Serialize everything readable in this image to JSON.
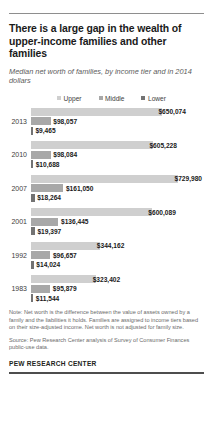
{
  "header": {
    "title": "There is a large gap in the wealth of upper-income families and other families",
    "subtitle": "Median net worth of families, by income tier and in 2014 dollars"
  },
  "legend": {
    "items": [
      {
        "label": "Upper",
        "color": "#cfcfcf"
      },
      {
        "label": "Middle",
        "color": "#a8a8a8"
      },
      {
        "label": "Lower",
        "color": "#737373"
      }
    ]
  },
  "footer": {
    "note": "Note: Net worth is the difference between the value of assets owned by a family and the liabilities it holds. Families are assigned to income tiers based on their size-adjusted income. Net worth is not adjusted for family size.",
    "source": "Source: Pew Research Center analysis of Survey of Consumer Finances public-use data.",
    "brand": "PEW RESEARCH CENTER"
  },
  "chart_data": {
    "type": "bar",
    "orientation": "horizontal",
    "title": "There is a large gap in the wealth of upper-income families and other families",
    "subtitle": "Median net worth of families, by income tier and in 2014 dollars",
    "xlabel": "",
    "ylabel": "",
    "xlim": [
      0,
      729980
    ],
    "grid": false,
    "legend_position": "top-center",
    "categories": [
      "2013",
      "2010",
      "2007",
      "2001",
      "1992",
      "1983"
    ],
    "series": [
      {
        "name": "Upper",
        "color": "#cfcfcf",
        "values": [
          650074,
          605228,
          729980,
          600089,
          344162,
          323402
        ],
        "labels": [
          "$650,074",
          "$605,228",
          "$729,980",
          "$600,089",
          "$344,162",
          "$323,402"
        ]
      },
      {
        "name": "Middle",
        "color": "#a8a8a8",
        "values": [
          98057,
          98084,
          161050,
          136445,
          96657,
          95879
        ],
        "labels": [
          "$98,057",
          "$98,084",
          "$161,050",
          "$136,445",
          "$96,657",
          "$95,879"
        ]
      },
      {
        "name": "Lower",
        "color": "#737373",
        "values": [
          9465,
          10688,
          18264,
          19397,
          14024,
          11544
        ],
        "labels": [
          "$9,465",
          "$10,688",
          "$18,264",
          "$19,397",
          "$14,024",
          "$11,544"
        ]
      }
    ],
    "groups": [
      {
        "year": "2013",
        "bars": [
          {
            "tier": "Upper",
            "value": 650074,
            "label": "$650,074"
          },
          {
            "tier": "Middle",
            "value": 98057,
            "label": "$98,057"
          },
          {
            "tier": "Lower",
            "value": 9465,
            "label": "$9,465"
          }
        ]
      },
      {
        "year": "2010",
        "bars": [
          {
            "tier": "Upper",
            "value": 605228,
            "label": "$605,228"
          },
          {
            "tier": "Middle",
            "value": 98084,
            "label": "$98,084"
          },
          {
            "tier": "Lower",
            "value": 10688,
            "label": "$10,688"
          }
        ]
      },
      {
        "year": "2007",
        "bars": [
          {
            "tier": "Upper",
            "value": 729980,
            "label": "$729,980"
          },
          {
            "tier": "Middle",
            "value": 161050,
            "label": "$161,050"
          },
          {
            "tier": "Lower",
            "value": 18264,
            "label": "$18,264"
          }
        ]
      },
      {
        "year": "2001",
        "bars": [
          {
            "tier": "Upper",
            "value": 600089,
            "label": "$600,089"
          },
          {
            "tier": "Middle",
            "value": 136445,
            "label": "$136,445"
          },
          {
            "tier": "Lower",
            "value": 19397,
            "label": "$19,397"
          }
        ]
      },
      {
        "year": "1992",
        "bars": [
          {
            "tier": "Upper",
            "value": 344162,
            "label": "$344,162"
          },
          {
            "tier": "Middle",
            "value": 96657,
            "label": "$96,657"
          },
          {
            "tier": "Lower",
            "value": 14024,
            "label": "$14,024"
          }
        ]
      },
      {
        "year": "1983",
        "bars": [
          {
            "tier": "Upper",
            "value": 323402,
            "label": "$323,402"
          },
          {
            "tier": "Middle",
            "value": 95879,
            "label": "$95,879"
          },
          {
            "tier": "Lower",
            "value": 11544,
            "label": "$11,544"
          }
        ]
      }
    ]
  }
}
